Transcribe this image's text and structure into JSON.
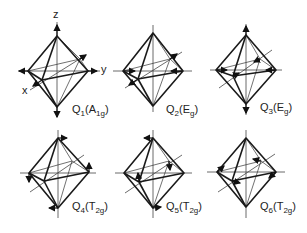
{
  "figure": {
    "axes_labels": {
      "x": "x",
      "y": "y",
      "z": "z"
    },
    "modes": [
      {
        "id": "Q1",
        "q": "Q",
        "index": "1",
        "symmetry": "A",
        "symmetry_sub": "1g"
      },
      {
        "id": "Q2",
        "q": "Q",
        "index": "2",
        "symmetry": "E",
        "symmetry_sub": "g"
      },
      {
        "id": "Q3",
        "q": "Q",
        "index": "3",
        "symmetry": "E",
        "symmetry_sub": "g"
      },
      {
        "id": "Q4",
        "q": "Q",
        "index": "4",
        "symmetry": "T",
        "symmetry_sub": "2g"
      },
      {
        "id": "Q5",
        "q": "Q",
        "index": "5",
        "symmetry": "T",
        "symmetry_sub": "2g"
      },
      {
        "id": "Q6",
        "q": "Q",
        "index": "6",
        "symmetry": "T",
        "symmetry_sub": "2g"
      }
    ]
  }
}
